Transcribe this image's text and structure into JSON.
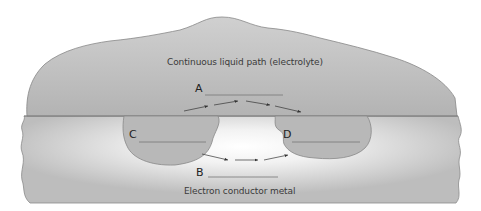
{
  "diagram": {
    "electrolyte_label": "Continuous liquid path (electrolyte)",
    "metal_label": "Electron conductor metal",
    "blanks": [
      {
        "letter": "A"
      },
      {
        "letter": "B"
      },
      {
        "letter": "C"
      },
      {
        "letter": "D"
      }
    ],
    "colors": {
      "electrolyte": "#b9b9b9",
      "metal": "#bfbfbf",
      "pit_highlight": "#ffffff",
      "outline": "#7a7a7a",
      "arrow": "#333333"
    }
  }
}
